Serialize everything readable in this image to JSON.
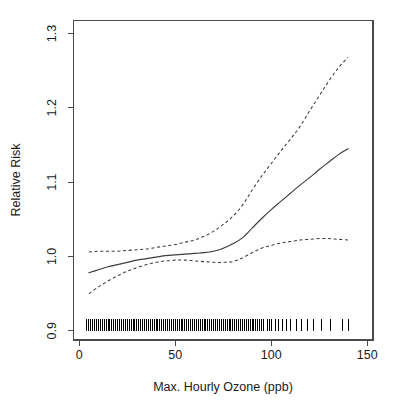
{
  "chart_data": {
    "type": "line",
    "title": "",
    "subtitle": "",
    "xlabel": "Max. Hourly Ozone (ppb)",
    "ylabel": "Relative Risk",
    "xlim": [
      -3,
      153
    ],
    "ylim": [
      0.8875,
      1.3175
    ],
    "xticks": [
      0,
      50,
      100,
      150
    ],
    "xtick_labels": [
      "0",
      "50",
      "100",
      "150"
    ],
    "yticks": [
      0.9,
      1.0,
      1.1,
      1.2,
      1.3
    ],
    "ytick_labels": [
      "0.9",
      "1.0",
      "1.1",
      "1.2",
      "1.3"
    ],
    "grid": false,
    "legend": null,
    "legend_position": "none",
    "annotations": [],
    "series": [
      {
        "name": "Estimated relative risk",
        "style": "solid",
        "color": "#3d3d3d",
        "x": [
          5,
          10,
          15,
          20,
          25,
          30,
          35,
          40,
          45,
          50,
          55,
          60,
          65,
          70,
          75,
          80,
          85,
          90,
          95,
          100,
          105,
          110,
          115,
          120,
          125,
          130,
          135,
          140
        ],
        "y": [
          0.978,
          0.982,
          0.986,
          0.989,
          0.992,
          0.995,
          0.997,
          0.999,
          1.001,
          1.002,
          1.003,
          1.004,
          1.005,
          1.007,
          1.011,
          1.017,
          1.025,
          1.038,
          1.051,
          1.063,
          1.074,
          1.085,
          1.096,
          1.106,
          1.117,
          1.127,
          1.137,
          1.145
        ]
      },
      {
        "name": "Upper 95% confidence limit",
        "style": "dashed",
        "color": "#3d3d3d",
        "x": [
          5,
          10,
          15,
          20,
          25,
          30,
          35,
          40,
          45,
          50,
          55,
          60,
          65,
          70,
          75,
          80,
          85,
          90,
          95,
          100,
          105,
          110,
          115,
          120,
          125,
          130,
          135,
          140
        ],
        "y": [
          1.006,
          1.007,
          1.007,
          1.007,
          1.008,
          1.009,
          1.01,
          1.012,
          1.014,
          1.016,
          1.019,
          1.022,
          1.027,
          1.034,
          1.043,
          1.054,
          1.069,
          1.089,
          1.108,
          1.125,
          1.142,
          1.158,
          1.175,
          1.196,
          1.216,
          1.236,
          1.254,
          1.268
        ]
      },
      {
        "name": "Lower 95% confidence limit",
        "style": "dashed",
        "color": "#3d3d3d",
        "x": [
          5,
          10,
          15,
          20,
          25,
          30,
          35,
          40,
          45,
          50,
          55,
          60,
          65,
          70,
          75,
          80,
          85,
          90,
          95,
          100,
          105,
          110,
          115,
          120,
          125,
          130,
          135,
          140
        ],
        "y": [
          0.95,
          0.959,
          0.967,
          0.974,
          0.98,
          0.985,
          0.989,
          0.992,
          0.994,
          0.995,
          0.995,
          0.994,
          0.993,
          0.992,
          0.992,
          0.993,
          0.998,
          1.005,
          1.011,
          1.015,
          1.018,
          1.02,
          1.022,
          1.023,
          1.024,
          1.024,
          1.023,
          1.022
        ]
      }
    ],
    "rug": {
      "name": "Observed ozone values",
      "axis": "x",
      "baseline_y": 0.9,
      "values": [
        4,
        5,
        5,
        6,
        6,
        6,
        7,
        7,
        8,
        8,
        8,
        9,
        9,
        9,
        10,
        10,
        10,
        10,
        11,
        11,
        11,
        12,
        12,
        12,
        12,
        13,
        13,
        13,
        14,
        14,
        14,
        14,
        15,
        15,
        15,
        15,
        16,
        16,
        16,
        16,
        17,
        17,
        17,
        17,
        18,
        18,
        18,
        18,
        18,
        19,
        19,
        19,
        19,
        20,
        20,
        20,
        20,
        20,
        21,
        21,
        21,
        21,
        22,
        22,
        22,
        22,
        22,
        23,
        23,
        23,
        23,
        24,
        24,
        24,
        24,
        24,
        25,
        25,
        25,
        25,
        26,
        26,
        26,
        26,
        26,
        27,
        27,
        27,
        27,
        28,
        28,
        28,
        28,
        28,
        29,
        29,
        29,
        29,
        30,
        30,
        30,
        30,
        30,
        31,
        31,
        31,
        31,
        32,
        32,
        32,
        32,
        32,
        33,
        33,
        33,
        33,
        34,
        34,
        34,
        34,
        35,
        35,
        35,
        35,
        35,
        36,
        36,
        36,
        36,
        37,
        37,
        37,
        37,
        38,
        38,
        38,
        38,
        39,
        39,
        39,
        39,
        40,
        40,
        40,
        40,
        41,
        41,
        41,
        42,
        42,
        42,
        42,
        43,
        43,
        43,
        44,
        44,
        44,
        45,
        45,
        45,
        46,
        46,
        46,
        47,
        47,
        47,
        48,
        48,
        48,
        49,
        49,
        49,
        50,
        50,
        50,
        51,
        51,
        51,
        52,
        52,
        52,
        53,
        53,
        54,
        54,
        54,
        55,
        55,
        56,
        56,
        57,
        57,
        58,
        58,
        59,
        59,
        60,
        60,
        61,
        61,
        62,
        62,
        63,
        63,
        64,
        64,
        65,
        65,
        66,
        66,
        67,
        67,
        68,
        68,
        69,
        70,
        70,
        71,
        71,
        72,
        72,
        73,
        74,
        74,
        75,
        76,
        76,
        77,
        78,
        78,
        79,
        80,
        80,
        81,
        82,
        83,
        84,
        85,
        86,
        87,
        88,
        89,
        90,
        91,
        92,
        93,
        94,
        95,
        96,
        98,
        99,
        100,
        102,
        104,
        106,
        108,
        110,
        113,
        116,
        119,
        122,
        126,
        131,
        137,
        140
      ]
    }
  },
  "axes": {
    "x_title": "Max. Hourly Ozone (ppb)",
    "y_title": "Relative Risk"
  }
}
